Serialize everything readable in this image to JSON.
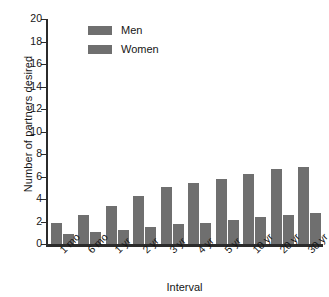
{
  "chart_data": {
    "type": "bar",
    "title": "",
    "xlabel": "Interval",
    "ylabel": "Number of partners desired",
    "categories": [
      "1 mo",
      "6 mo",
      "1 yr",
      "2 yr",
      "3 yr",
      "4 yr",
      "5 yr",
      "10 yr",
      "20 yr",
      "30 yr"
    ],
    "series": [
      {
        "name": "Men",
        "values": [
          1.9,
          2.6,
          3.4,
          4.3,
          5.1,
          5.4,
          5.8,
          6.2,
          6.7,
          6.85
        ],
        "color": "#6f6f6f"
      },
      {
        "name": "Women",
        "values": [
          0.85,
          1.1,
          1.25,
          1.5,
          1.75,
          1.9,
          2.1,
          2.4,
          2.55,
          2.75
        ],
        "color": "#6f6f6f"
      }
    ],
    "ylim": [
      0,
      20
    ],
    "ytick_step": 2,
    "yticks": [
      0,
      2,
      4,
      6,
      8,
      10,
      12,
      14,
      16,
      18,
      20
    ],
    "ytick_labels": [
      "0",
      "2",
      "4",
      "6",
      "8",
      "10",
      "12",
      "14",
      "16",
      "18",
      "20"
    ],
    "grid": false,
    "legend_position": "top-left",
    "legend_entries": [
      "Men",
      "Women"
    ],
    "axis_color": "#2b2b2b",
    "background": "#ffffff"
  }
}
